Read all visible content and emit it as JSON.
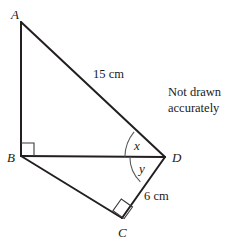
{
  "figure": {
    "note": {
      "line1": "Not drawn",
      "line2": "accurately"
    },
    "vertices": [
      {
        "id": "A",
        "label": "A",
        "x": 21,
        "y": 22
      },
      {
        "id": "B",
        "label": "B",
        "x": 21,
        "y": 156
      },
      {
        "id": "C",
        "label": "C",
        "x": 122,
        "y": 218
      },
      {
        "id": "D",
        "label": "D",
        "x": 165,
        "y": 157
      }
    ],
    "edges": [
      {
        "from": "A",
        "to": "B"
      },
      {
        "from": "A",
        "to": "D"
      },
      {
        "from": "B",
        "to": "D"
      },
      {
        "from": "B",
        "to": "C"
      },
      {
        "from": "C",
        "to": "D"
      }
    ],
    "measures": [
      {
        "id": "AD",
        "label": "15 cm",
        "edge": "A-D"
      },
      {
        "id": "CD",
        "label": "6 cm",
        "edge": "C-D"
      }
    ],
    "angles": [
      {
        "id": "x",
        "label": "x",
        "vertex": "D",
        "between": "BD-AD"
      },
      {
        "id": "y",
        "label": "y",
        "vertex": "D",
        "between": "BD-CD"
      }
    ],
    "right_angles": [
      {
        "id": "angle-ABD",
        "vertex": "B"
      },
      {
        "id": "angle-BCD",
        "vertex": "C"
      }
    ],
    "colors": {
      "stroke": "#231f20",
      "arc": "#5b5b5b",
      "text": "#1a1a1a",
      "background": "#ffffff"
    }
  }
}
